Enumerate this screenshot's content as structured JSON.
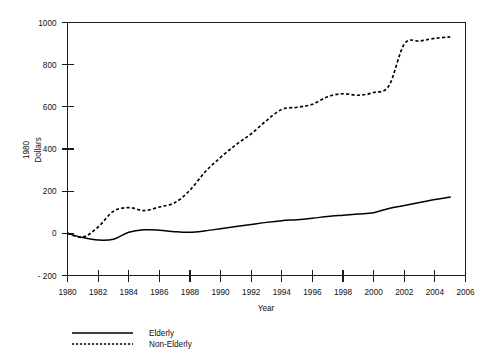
{
  "chart_data": {
    "type": "line",
    "title": "",
    "xlabel": "Year",
    "ylabel": "1980 Dollars",
    "ylabel_lines": [
      "1980",
      "Dollars"
    ],
    "xlim": [
      1980,
      2006
    ],
    "ylim": [
      -200,
      1000
    ],
    "xticks": [
      1980,
      1982,
      1984,
      1986,
      1988,
      1990,
      1992,
      1994,
      1996,
      1998,
      2000,
      2002,
      2004,
      2006
    ],
    "yticks": [
      -200,
      0,
      200,
      400,
      600,
      800,
      1000
    ],
    "xticklabels": [
      "1980",
      "1982",
      "1984",
      "1986",
      "1988",
      "1990",
      "1992",
      "1994",
      "1996",
      "1998",
      "2000",
      "2002",
      "2004",
      "2006"
    ],
    "yticklabels": [
      "- 200",
      "0",
      "200",
      "400",
      "600",
      "800",
      "1000"
    ],
    "grid": false,
    "legend_position": "below-left",
    "x": [
      1980,
      1981,
      1982,
      1983,
      1984,
      1985,
      1986,
      1987,
      1988,
      1989,
      1990,
      1991,
      1992,
      1993,
      1994,
      1995,
      1996,
      1997,
      1998,
      1999,
      2000,
      2001,
      2002,
      2003,
      2004,
      2005
    ],
    "series": [
      {
        "name": "Elderly",
        "style": "solid",
        "color": "#000000",
        "values": [
          0,
          -20,
          -32,
          -28,
          5,
          17,
          15,
          8,
          5,
          12,
          22,
          32,
          42,
          52,
          60,
          65,
          72,
          80,
          86,
          92,
          98,
          118,
          132,
          146,
          160,
          172
        ]
      },
      {
        "name": "Non-Elderly",
        "style": "dotted",
        "color": "#000000",
        "values": [
          0,
          -18,
          30,
          105,
          122,
          108,
          125,
          145,
          205,
          292,
          360,
          420,
          472,
          535,
          588,
          598,
          612,
          648,
          662,
          655,
          668,
          700,
          898,
          912,
          925,
          932
        ]
      }
    ]
  },
  "legend": {
    "items": [
      {
        "label": "Elderly",
        "style": "solid"
      },
      {
        "label": "Non-Elderly",
        "style": "dotted"
      }
    ]
  }
}
